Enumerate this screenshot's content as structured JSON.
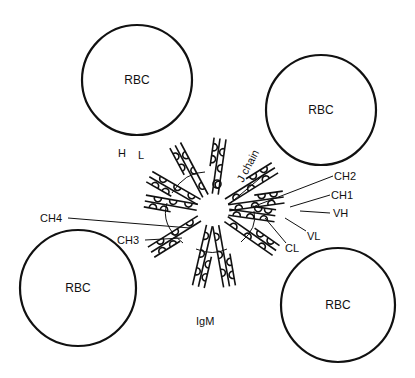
{
  "diagram": {
    "title": "IgM",
    "cells": [
      {
        "label": "RBC",
        "cx": 137,
        "cy": 80,
        "r": 55
      },
      {
        "label": "RBC",
        "cx": 321,
        "cy": 110,
        "r": 55
      },
      {
        "label": "RBC",
        "cx": 78,
        "cy": 288,
        "r": 58
      },
      {
        "label": "RBC",
        "cx": 338,
        "cy": 305,
        "r": 57
      }
    ],
    "center": {
      "x": 213,
      "y": 210
    },
    "labels": {
      "h": "H",
      "l": "L",
      "j_chain": "J chain",
      "ch2": "CH2",
      "ch1": "CH1",
      "vh": "VH",
      "vl": "VL",
      "cl": "CL",
      "ch4": "CH4",
      "ch3": "CH3",
      "igm": "IgM"
    }
  }
}
